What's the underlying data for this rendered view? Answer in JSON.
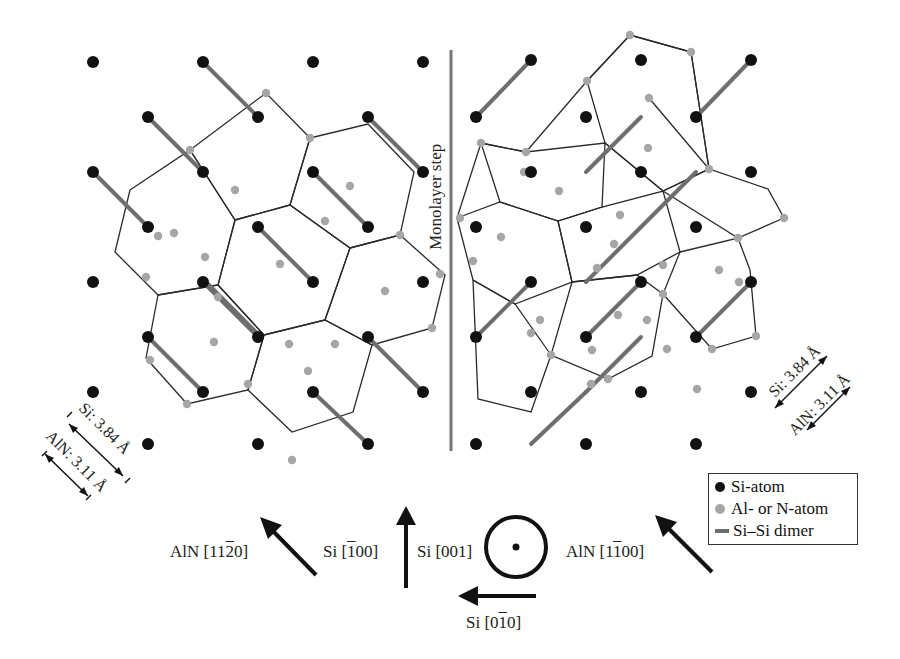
{
  "colors": {
    "si_atom": "#111111",
    "aln_atom": "#a6a6a6",
    "dimer": "#6e6e6e",
    "hex_line": "#2a2a2a",
    "step_line": "#777777"
  },
  "step_label": "Monolayer step",
  "legend": {
    "items": [
      {
        "label": "Si-atom",
        "symbol": "black-dot"
      },
      {
        "label": "Al- or N-atom",
        "symbol": "gray-dot"
      },
      {
        "label": "Si–Si dimer",
        "symbol": "gray-line"
      }
    ]
  },
  "scale_bars": {
    "left": {
      "si": "Si: 3.84 Å",
      "aln": "AlN: 3.11 Å"
    },
    "right": {
      "si": "Si: 3.84 Å",
      "aln": "AlN: 3.11 Å"
    }
  },
  "directions": {
    "aln_1120": {
      "prefix": "AlN [11",
      "bar": "2",
      "suffix": "0]"
    },
    "si_100": {
      "prefix": "Si [",
      "bar": "1",
      "suffix": "00]"
    },
    "si_001": "Si [001]",
    "aln_1100": {
      "prefix": "AlN [1",
      "bar": "1",
      "suffix": "00]"
    },
    "si_010": {
      "prefix": "Si [0",
      "bar": "1",
      "suffix": "0]"
    }
  },
  "lattice": {
    "si_atoms": [
      [
        93,
        62
      ],
      [
        203,
        62
      ],
      [
        313,
        62
      ],
      [
        423,
        62
      ],
      [
        148,
        117
      ],
      [
        258,
        117
      ],
      [
        368,
        117
      ],
      [
        93,
        172
      ],
      [
        203,
        172
      ],
      [
        313,
        172
      ],
      [
        423,
        172
      ],
      [
        148,
        227
      ],
      [
        258,
        227
      ],
      [
        368,
        227
      ],
      [
        93,
        282
      ],
      [
        203,
        282
      ],
      [
        313,
        282
      ],
      [
        423,
        282
      ],
      [
        148,
        337
      ],
      [
        258,
        337
      ],
      [
        368,
        337
      ],
      [
        93,
        392
      ],
      [
        203,
        392
      ],
      [
        313,
        392
      ],
      [
        423,
        392
      ],
      [
        148,
        444
      ],
      [
        258,
        444
      ],
      [
        368,
        444
      ],
      [
        531,
        60
      ],
      [
        641,
        60
      ],
      [
        751,
        60
      ],
      [
        476,
        117
      ],
      [
        586,
        117
      ],
      [
        696,
        117
      ],
      [
        531,
        172
      ],
      [
        641,
        172
      ],
      [
        751,
        172
      ],
      [
        476,
        227
      ],
      [
        586,
        227
      ],
      [
        696,
        227
      ],
      [
        531,
        282
      ],
      [
        641,
        282
      ],
      [
        751,
        282
      ],
      [
        476,
        337
      ],
      [
        586,
        337
      ],
      [
        696,
        337
      ],
      [
        531,
        392
      ],
      [
        641,
        392
      ],
      [
        751,
        392
      ],
      [
        476,
        444
      ],
      [
        586,
        444
      ],
      [
        696,
        444
      ]
    ],
    "dimers": [
      [
        203,
        62,
        258,
        117
      ],
      [
        148,
        117,
        203,
        172
      ],
      [
        93,
        172,
        148,
        227
      ],
      [
        368,
        117,
        423,
        172
      ],
      [
        313,
        172,
        368,
        227
      ],
      [
        258,
        227,
        313,
        282
      ],
      [
        203,
        282,
        258,
        337
      ],
      [
        148,
        337,
        203,
        392
      ],
      [
        368,
        337,
        423,
        392
      ],
      [
        313,
        392,
        368,
        444
      ],
      [
        206,
        282,
        261,
        337
      ],
      [
        531,
        60,
        476,
        117
      ],
      [
        641,
        117,
        586,
        172
      ],
      [
        751,
        60,
        696,
        117
      ],
      [
        696,
        172,
        641,
        227
      ],
      [
        641,
        227,
        586,
        282
      ],
      [
        531,
        282,
        476,
        337
      ],
      [
        641,
        282,
        586,
        337
      ],
      [
        751,
        282,
        696,
        337
      ],
      [
        641,
        337,
        586,
        392
      ],
      [
        586,
        392,
        531,
        444
      ]
    ],
    "aln_atoms": [
      [
        266,
        93
      ],
      [
        190,
        150
      ],
      [
        310,
        138
      ],
      [
        235,
        190
      ],
      [
        350,
        186
      ],
      [
        158,
        236
      ],
      [
        280,
        264
      ],
      [
        205,
        257
      ],
      [
        385,
        291
      ],
      [
        174,
        233
      ],
      [
        325,
        221
      ],
      [
        335,
        344
      ],
      [
        218,
        297
      ],
      [
        150,
        360
      ],
      [
        187,
        404
      ],
      [
        248,
        384
      ],
      [
        292,
        460
      ],
      [
        440,
        274
      ],
      [
        400,
        235
      ],
      [
        432,
        328
      ],
      [
        289,
        344
      ],
      [
        308,
        371
      ],
      [
        214,
        342
      ],
      [
        146,
        277
      ],
      [
        630,
        35
      ],
      [
        691,
        52
      ],
      [
        587,
        81
      ],
      [
        649,
        98
      ],
      [
        526,
        152
      ],
      [
        524,
        172
      ],
      [
        481,
        143
      ],
      [
        501,
        237
      ],
      [
        460,
        218
      ],
      [
        473,
        261
      ],
      [
        559,
        191
      ],
      [
        614,
        244
      ],
      [
        663,
        294
      ],
      [
        618,
        315
      ],
      [
        648,
        148
      ],
      [
        709,
        169
      ],
      [
        784,
        218
      ],
      [
        738,
        238
      ],
      [
        719,
        270
      ],
      [
        739,
        282
      ],
      [
        756,
        336
      ],
      [
        712,
        349
      ],
      [
        608,
        379
      ],
      [
        551,
        355
      ],
      [
        597,
        268
      ],
      [
        663,
        265
      ],
      [
        620,
        215
      ],
      [
        540,
        320
      ],
      [
        647,
        320
      ],
      [
        531,
        333
      ],
      [
        592,
        350
      ],
      [
        667,
        349
      ],
      [
        697,
        389
      ],
      [
        591,
        384
      ]
    ],
    "hexagons": [
      [
        [
          190,
          150
        ],
        [
          266,
          93
        ],
        [
          310,
          138
        ],
        [
          290,
          205
        ],
        [
          235,
          220
        ],
        [
          190,
          150
        ]
      ],
      [
        [
          310,
          138
        ],
        [
          368,
          124
        ],
        [
          414,
          172
        ],
        [
          400,
          235
        ],
        [
          350,
          248
        ],
        [
          290,
          205
        ],
        [
          310,
          138
        ]
      ],
      [
        [
          130,
          190
        ],
        [
          190,
          150
        ],
        [
          235,
          220
        ],
        [
          218,
          285
        ],
        [
          158,
          295
        ],
        [
          115,
          252
        ],
        [
          130,
          190
        ]
      ],
      [
        [
          235,
          220
        ],
        [
          290,
          205
        ],
        [
          350,
          248
        ],
        [
          325,
          320
        ],
        [
          264,
          335
        ],
        [
          218,
          285
        ],
        [
          235,
          220
        ]
      ],
      [
        [
          350,
          248
        ],
        [
          400,
          235
        ],
        [
          445,
          275
        ],
        [
          432,
          328
        ],
        [
          372,
          345
        ],
        [
          325,
          320
        ],
        [
          350,
          248
        ]
      ],
      [
        [
          158,
          295
        ],
        [
          218,
          285
        ],
        [
          264,
          335
        ],
        [
          248,
          390
        ],
        [
          187,
          404
        ],
        [
          146,
          358
        ],
        [
          158,
          295
        ]
      ],
      [
        [
          264,
          335
        ],
        [
          325,
          320
        ],
        [
          372,
          345
        ],
        [
          353,
          412
        ],
        [
          292,
          432
        ],
        [
          248,
          390
        ],
        [
          264,
          335
        ]
      ],
      [
        [
          457,
          218
        ],
        [
          481,
          143
        ],
        [
          526,
          152
        ],
        [
          587,
          81
        ],
        [
          630,
          35
        ],
        [
          691,
          52
        ],
        [
          709,
          169
        ],
        [
          649,
          98
        ]
      ],
      [
        [
          587,
          81
        ],
        [
          630,
          35
        ],
        [
          691,
          52
        ],
        [
          709,
          169
        ],
        [
          663,
          191
        ],
        [
          605,
          143
        ],
        [
          587,
          81
        ]
      ],
      [
        [
          481,
          143
        ],
        [
          526,
          152
        ],
        [
          605,
          143
        ],
        [
          602,
          207
        ],
        [
          558,
          221
        ],
        [
          500,
          202
        ],
        [
          481,
          143
        ]
      ],
      [
        [
          605,
          143
        ],
        [
          663,
          191
        ],
        [
          709,
          169
        ],
        [
          768,
          189
        ],
        [
          784,
          218
        ],
        [
          738,
          238
        ],
        [
          663,
          191
        ]
      ],
      [
        [
          457,
          218
        ],
        [
          500,
          202
        ],
        [
          558,
          221
        ],
        [
          572,
          282
        ],
        [
          515,
          304
        ],
        [
          473,
          280
        ],
        [
          457,
          218
        ]
      ],
      [
        [
          558,
          221
        ],
        [
          602,
          207
        ],
        [
          663,
          191
        ],
        [
          680,
          252
        ],
        [
          637,
          275
        ],
        [
          572,
          282
        ],
        [
          558,
          221
        ]
      ],
      [
        [
          680,
          252
        ],
        [
          738,
          238
        ],
        [
          750,
          270
        ],
        [
          756,
          336
        ],
        [
          712,
          349
        ],
        [
          663,
          294
        ],
        [
          680,
          252
        ]
      ],
      [
        [
          572,
          282
        ],
        [
          637,
          275
        ],
        [
          663,
          294
        ],
        [
          652,
          356
        ],
        [
          608,
          379
        ],
        [
          551,
          355
        ],
        [
          572,
          282
        ]
      ],
      [
        [
          473,
          280
        ],
        [
          515,
          304
        ],
        [
          551,
          355
        ],
        [
          531,
          412
        ],
        [
          478,
          399
        ],
        [
          473,
          280
        ]
      ]
    ]
  }
}
